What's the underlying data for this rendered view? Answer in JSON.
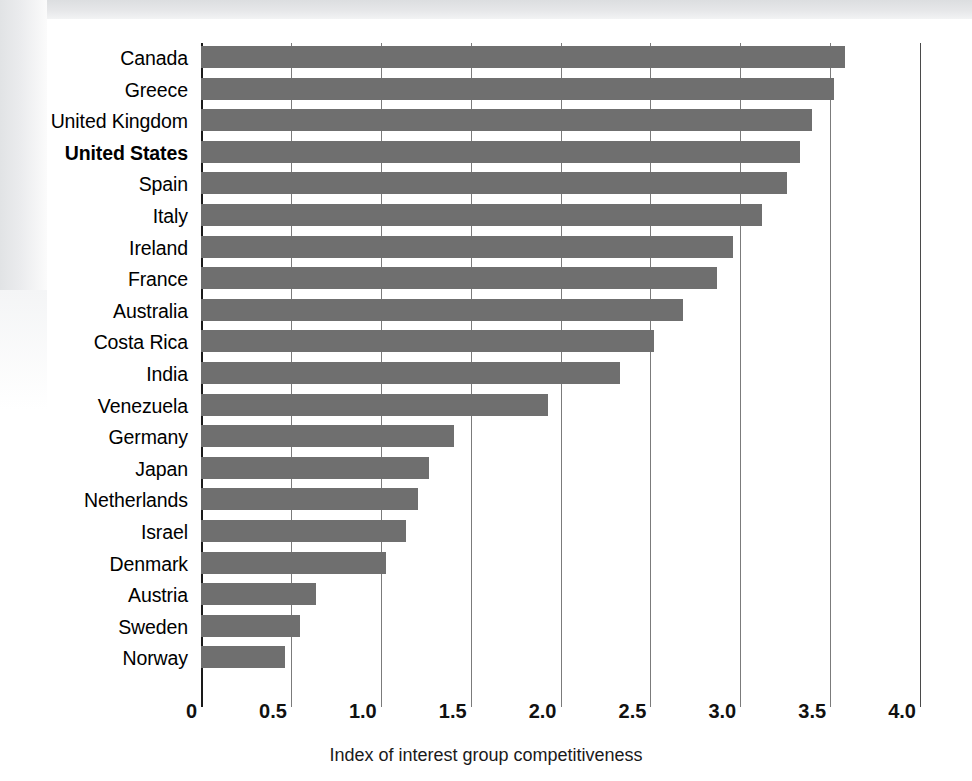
{
  "chart_data": {
    "type": "bar",
    "orientation": "horizontal",
    "title": "",
    "xlabel": "Index of interest group competitiveness",
    "ylabel": "",
    "xlim": [
      0,
      4.0
    ],
    "xticks": [
      "0",
      "0.5",
      "1.0",
      "1.5",
      "2.0",
      "2.5",
      "3.0",
      "3.5",
      "4.0"
    ],
    "xtick_values": [
      0,
      0.5,
      1.0,
      1.5,
      2.0,
      2.5,
      3.0,
      3.5,
      4.0
    ],
    "grid": true,
    "legend": null,
    "bar_color": "#6f6f6f",
    "highlight_category": "United States",
    "categories": [
      "Canada",
      "Greece",
      "United Kingdom",
      "United States",
      "Spain",
      "Italy",
      "Ireland",
      "France",
      "Australia",
      "Costa Rica",
      "India",
      "Venezuela",
      "Germany",
      "Japan",
      "Netherlands",
      "Israel",
      "Denmark",
      "Austria",
      "Sweden",
      "Norway"
    ],
    "values": [
      3.58,
      3.52,
      3.4,
      3.33,
      3.26,
      3.12,
      2.96,
      2.87,
      2.68,
      2.52,
      2.33,
      1.93,
      1.41,
      1.27,
      1.21,
      1.14,
      1.03,
      0.64,
      0.55,
      0.47
    ]
  }
}
